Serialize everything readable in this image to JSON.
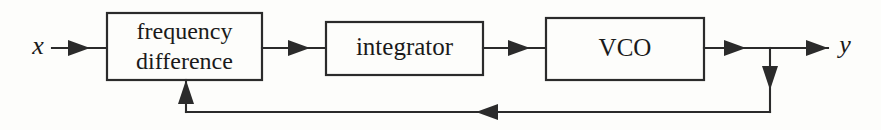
{
  "diagram": {
    "type": "block-diagram",
    "background_color": "#fdfdfb",
    "line_color": "#2b2b2b",
    "text_color": "#1a1a1a",
    "canvas": {
      "width": 881,
      "height": 130
    },
    "input": {
      "label": "x",
      "style": "italic",
      "x": 38,
      "y": 48
    },
    "output": {
      "label": "y",
      "style": "italic",
      "x": 843,
      "y": 48
    },
    "blocks": [
      {
        "id": "frequency-difference",
        "lines": [
          "frequency",
          "difference"
        ],
        "line1": "frequency",
        "line2": "difference",
        "x": 107,
        "y": 13,
        "width": 155,
        "height": 67,
        "cx": 184,
        "cy": 46
      },
      {
        "id": "integrator",
        "lines": [
          "integrator"
        ],
        "line1": "integrator",
        "x": 326,
        "y": 22,
        "width": 157,
        "height": 53,
        "cx": 404,
        "cy": 48
      },
      {
        "id": "vco",
        "lines": [
          "VCO"
        ],
        "line1": "VCO",
        "x": 546,
        "y": 18,
        "width": 158,
        "height": 62,
        "cx": 625,
        "cy": 49
      }
    ],
    "connections": [
      {
        "id": "input-to-freqdiff",
        "from": "x",
        "to": "frequency-difference",
        "direction": "right",
        "y": 48
      },
      {
        "id": "freqdiff-to-integrator",
        "from": "frequency-difference",
        "to": "integrator",
        "direction": "right",
        "y": 48
      },
      {
        "id": "integrator-to-vco",
        "from": "integrator",
        "to": "vco",
        "direction": "right",
        "y": 48
      },
      {
        "id": "vco-to-output",
        "from": "vco",
        "to": "y",
        "direction": "right",
        "y": 48
      },
      {
        "id": "branch-down",
        "from": "vco-output-node",
        "to": "feedback-bus",
        "direction": "down",
        "x": 770
      },
      {
        "id": "feedback-bus",
        "from": "branch-down",
        "to": "freqdiff-bottom",
        "direction": "left",
        "y": 112
      },
      {
        "id": "feedback-up",
        "from": "feedback-bus",
        "to": "frequency-difference",
        "direction": "up",
        "x": 186
      }
    ]
  }
}
